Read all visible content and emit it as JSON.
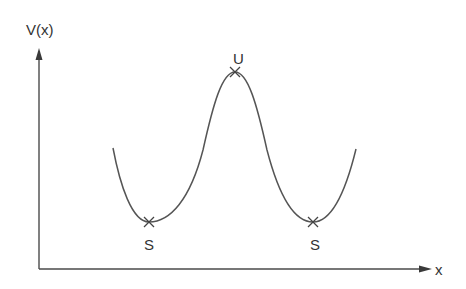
{
  "diagram": {
    "axes": {
      "y_label": "V(x)",
      "x_label": "x"
    },
    "points": [
      {
        "label": "S",
        "kind": "stable-minimum-left"
      },
      {
        "label": "U",
        "kind": "unstable-maximum"
      },
      {
        "label": "S",
        "kind": "stable-minimum-right"
      }
    ],
    "colors": {
      "axis": "#4a4a4a",
      "curve": "#555555",
      "text": "#333333"
    }
  }
}
